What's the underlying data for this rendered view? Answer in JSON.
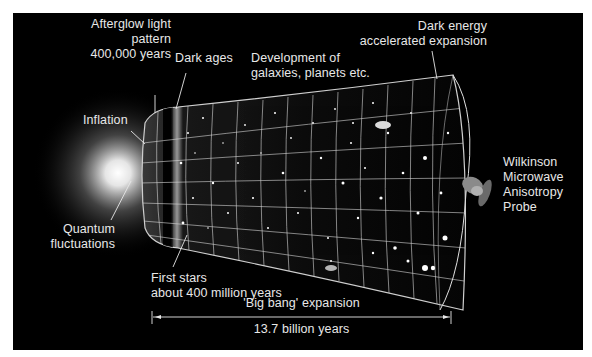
{
  "diagram": {
    "labels": {
      "afterglow": [
        "Afterglow light",
        "pattern",
        "400,000 years"
      ],
      "dark_ages": "Dark ages",
      "development": [
        "Development of",
        "galaxies, planets etc."
      ],
      "dark_energy": [
        "Dark energy",
        "accelerated expansion"
      ],
      "inflation": "Inflation",
      "quantum": [
        "Quantum",
        "fluctuations"
      ],
      "first_stars": [
        "First stars",
        "about 400 million years"
      ],
      "wmap": [
        "Wilkinson",
        "Microwave",
        "Anisotropy",
        "Probe"
      ],
      "expansion": "'Big bang' expansion",
      "duration": "13.7 billion years"
    },
    "colors": {
      "background": "#000000",
      "page": "#ffffff",
      "text": "#e8e8e8",
      "grid": "#d8d8d8"
    }
  }
}
